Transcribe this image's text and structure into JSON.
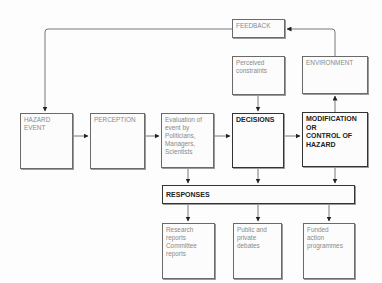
{
  "diagram": {
    "nodes": {
      "feedback": "FEEDBACK",
      "perceived_constraints": "Perceived\nconstraints",
      "environment": "ENVIRONMENT",
      "hazard_event": "HAZARD\nEVENT",
      "perception": "PERCEPTION",
      "evaluation": "Evaluation of\nevent by\nPoliticians,\nManagers,\nScientists",
      "decisions": "DECISIONS",
      "modification": "MODIFICATION\nOR\nCONTROL OF\nHAZARD",
      "responses": "RESPONSES",
      "research_reports": "Research\nreports\nCommittee\nreports",
      "debates": "Public and\nprivate debates",
      "funded_action": "Funded\naction\nprogrammes"
    },
    "edges": [
      [
        "feedback",
        "hazard_event"
      ],
      [
        "environment",
        "feedback"
      ],
      [
        "hazard_event",
        "perception"
      ],
      [
        "perception",
        "evaluation"
      ],
      [
        "evaluation",
        "decisions"
      ],
      [
        "decisions",
        "modification"
      ],
      [
        "perceived_constraints",
        "decisions"
      ],
      [
        "modification",
        "environment"
      ],
      [
        "evaluation",
        "responses"
      ],
      [
        "decisions",
        "responses"
      ],
      [
        "modification",
        "responses"
      ],
      [
        "responses",
        "research_reports"
      ],
      [
        "responses",
        "debates"
      ],
      [
        "responses",
        "funded_action"
      ]
    ]
  }
}
